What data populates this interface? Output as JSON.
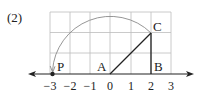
{
  "problem_label": "(2)",
  "colors": {
    "grid": "#bdbdbd",
    "axis": "#222222",
    "segment": "#222222",
    "arc": "#8a8a8a"
  },
  "points": {
    "P": {
      "label": "P",
      "x": -2.83,
      "y": 0
    },
    "A": {
      "label": "A",
      "x": 0,
      "y": 0
    },
    "B": {
      "label": "B",
      "x": 2,
      "y": 0
    },
    "C": {
      "label": "C",
      "x": 2,
      "y": 2
    }
  },
  "axis": {
    "ticks": [
      {
        "value": -3,
        "label": "−3"
      },
      {
        "value": -2,
        "label": "−2"
      },
      {
        "value": -1,
        "label": "−1"
      },
      {
        "value": 0,
        "label": "0"
      },
      {
        "value": 1,
        "label": "1"
      },
      {
        "value": 2,
        "label": "2"
      },
      {
        "value": 3,
        "label": "3"
      }
    ]
  }
}
